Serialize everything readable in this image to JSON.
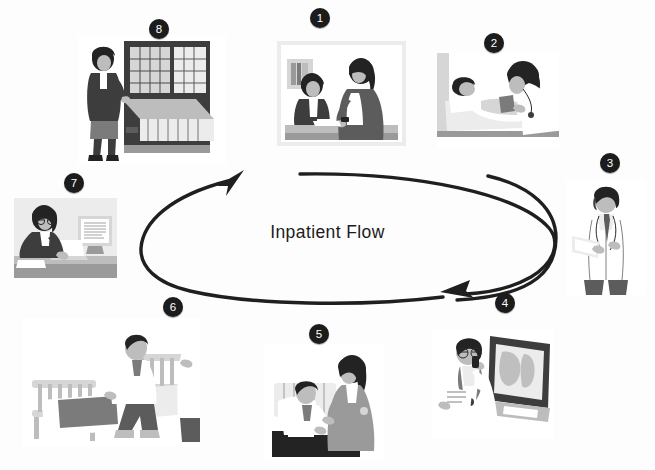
{
  "diagram": {
    "center_label": "Inpatient Flow",
    "flow_direction": "clockwise",
    "background_color": "#ffffff",
    "badge_color": "#1c1c1c",
    "badge_text_color": "#ffffff",
    "arrow_color": "#1f1f1f"
  },
  "steps": [
    {
      "number": "1",
      "name": "admission-registration",
      "description": "Patient registering with a clerk at the admissions desk",
      "badge": {
        "x": 310,
        "y": 8
      },
      "frame": {
        "x": 277,
        "y": 41,
        "w": 129,
        "h": 105
      }
    },
    {
      "number": "2",
      "name": "initial-assessment",
      "description": "Nurse taking blood pressure of patient lying in bed",
      "badge": {
        "x": 484,
        "y": 33
      },
      "frame": {
        "x": 437,
        "y": 53,
        "w": 122,
        "h": 95
      }
    },
    {
      "number": "3",
      "name": "physician-review",
      "description": "Doctor in white coat reviewing the patient chart",
      "badge": {
        "x": 600,
        "y": 153
      },
      "frame": {
        "x": 566,
        "y": 180,
        "w": 80,
        "h": 115
      }
    },
    {
      "number": "4",
      "name": "diagnostic-imaging",
      "description": "Radiologist dictating findings while reading an X-ray on a lightbox",
      "badge": {
        "x": 495,
        "y": 293
      },
      "frame": {
        "x": 432,
        "y": 330,
        "w": 122,
        "h": 108
      }
    },
    {
      "number": "5",
      "name": "nursing-care",
      "description": "Nurse attending to the patient in the hospital bed",
      "badge": {
        "x": 309,
        "y": 324
      },
      "frame": {
        "x": 264,
        "y": 345,
        "w": 120,
        "h": 115
      }
    },
    {
      "number": "6",
      "name": "discharge",
      "description": "Patient seated on the bed edge assisted by an attendant before discharge",
      "badge": {
        "x": 163,
        "y": 297
      },
      "frame": {
        "x": 22,
        "y": 318,
        "w": 178,
        "h": 128
      }
    },
    {
      "number": "7",
      "name": "billing-data-entry",
      "description": "Clerk entering patient data at a desktop computer",
      "badge": {
        "x": 64,
        "y": 173
      },
      "frame": {
        "x": 14,
        "y": 198,
        "w": 103,
        "h": 80
      }
    },
    {
      "number": "8",
      "name": "medical-records-filing",
      "description": "Records clerk filing the chart in the medical records cabinets",
      "badge": {
        "x": 149,
        "y": 19
      },
      "frame": {
        "x": 78,
        "y": 35,
        "w": 148,
        "h": 130
      }
    }
  ]
}
